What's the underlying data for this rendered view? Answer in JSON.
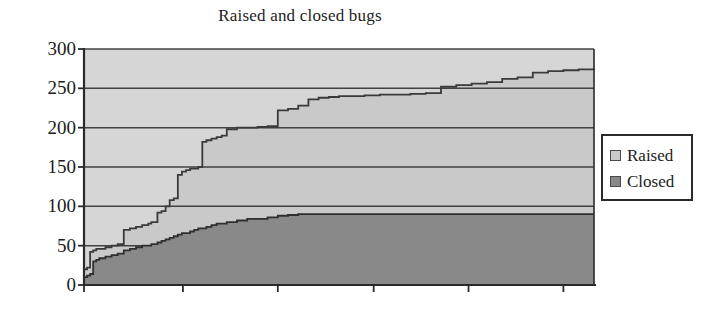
{
  "chart_data": {
    "type": "area",
    "title": "Raised and closed bugs",
    "xlabel": "",
    "ylabel": "",
    "ylim": [
      0,
      300
    ],
    "xlim": [
      0,
      100
    ],
    "yticks": [
      0,
      50,
      100,
      150,
      200,
      250,
      300
    ],
    "ytick_labels": [
      "0",
      "50",
      "100",
      "150",
      "200",
      "250",
      "300"
    ],
    "xticks": [
      0,
      19.4,
      38.0,
      56.8,
      75.4,
      94.0
    ],
    "xtick_labels": [
      "",
      "",
      "",
      "",
      "",
      ""
    ],
    "grid": true,
    "grid_axis": "y",
    "stacked": false,
    "step": true,
    "legend_position": "right",
    "series": [
      {
        "name": "Raised",
        "color": "#c9c9c9",
        "line_color": "#3a3a3a",
        "x": [
          0.0,
          0.6,
          1.2,
          1.8,
          2.4,
          3.0,
          4.2,
          5.4,
          6.6,
          7.8,
          9.0,
          10.2,
          11.4,
          12.6,
          13.2,
          14.4,
          15.2,
          16.0,
          16.8,
          17.6,
          18.4,
          19.2,
          20.0,
          20.8,
          21.6,
          22.4,
          23.2,
          24.0,
          25.0,
          26.0,
          27.0,
          28.0,
          30.0,
          32.0,
          34.0,
          36.0,
          38.0,
          40.0,
          42.0,
          44.0,
          46.0,
          48.0,
          50.0,
          52.0,
          55.0,
          58.0,
          61.0,
          64.0,
          67.0,
          70.0,
          73.0,
          76.0,
          79.0,
          82.0,
          85.0,
          88.0,
          91.0,
          94.0,
          97.0,
          100.0
        ],
        "y": [
          20,
          22,
          42,
          44,
          46,
          46,
          48,
          50,
          52,
          70,
          72,
          74,
          76,
          78,
          80,
          92,
          94,
          100,
          108,
          110,
          140,
          144,
          146,
          148,
          148,
          150,
          182,
          184,
          186,
          188,
          190,
          198,
          200,
          200,
          201,
          202,
          222,
          224,
          228,
          236,
          238,
          239,
          240,
          240,
          241,
          242,
          242,
          243,
          244,
          252,
          254,
          256,
          258,
          262,
          264,
          270,
          272,
          273,
          274,
          275
        ]
      },
      {
        "name": "Closed",
        "color": "#898989",
        "line_color": "#2f2f2f",
        "x": [
          0.0,
          0.6,
          1.2,
          1.8,
          2.4,
          3.0,
          4.2,
          5.4,
          6.6,
          7.8,
          9.0,
          10.2,
          11.4,
          12.6,
          13.2,
          14.4,
          15.2,
          16.0,
          16.8,
          17.6,
          18.4,
          19.2,
          20.0,
          20.8,
          21.6,
          22.4,
          23.2,
          24.0,
          25.0,
          26.0,
          27.0,
          28.0,
          30.0,
          32.0,
          34.0,
          36.0,
          38.0,
          40.0,
          42.0,
          44.0,
          46.0,
          48.0,
          50.0,
          55.0,
          60.0,
          65.0,
          70.0,
          75.0,
          80.0,
          85.0,
          90.0,
          95.0,
          100.0
        ],
        "y": [
          10,
          12,
          14,
          30,
          32,
          34,
          36,
          38,
          40,
          44,
          46,
          48,
          50,
          50,
          52,
          54,
          56,
          58,
          60,
          62,
          64,
          66,
          66,
          68,
          70,
          72,
          72,
          74,
          76,
          78,
          78,
          80,
          82,
          84,
          84,
          86,
          88,
          89,
          90,
          90,
          90,
          90,
          90,
          90,
          90,
          90,
          90,
          90,
          90,
          90,
          90,
          90,
          90
        ]
      }
    ]
  },
  "legend": {
    "items": [
      {
        "label": "Raised",
        "color": "#c9c9c9"
      },
      {
        "label": "Closed",
        "color": "#898989"
      }
    ]
  },
  "colors": {
    "raised_fill": "#c9c9c9",
    "closed_fill": "#898989",
    "axis": "#2a2a2a",
    "grid": "#3a3a3a",
    "background": "#ffffff",
    "text": "#1c1c1c"
  }
}
